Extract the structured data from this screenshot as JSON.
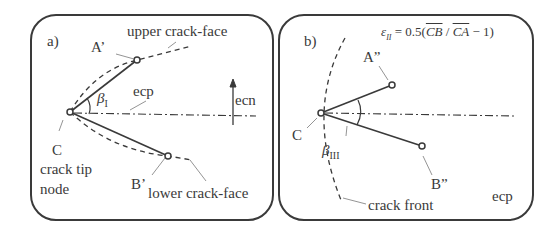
{
  "panel_a": {
    "tag": "a)",
    "point_A": "A’",
    "point_B": "B’",
    "point_C": "C",
    "upper_face": "upper crack-face",
    "lower_face": "lower crack-face",
    "tip_node_line1": "crack tip",
    "tip_node_line2": "node",
    "ecp": "ecp",
    "ecn": "ecn",
    "beta": "β",
    "beta_sub": "I"
  },
  "panel_b": {
    "tag": "b)",
    "formula": "ε",
    "formula_sub": "II",
    "formula_rest": " = 0.5(",
    "formula_cb": "CB",
    "formula_slash": " / ",
    "formula_ca": "CA",
    "formula_end": " − 1)",
    "point_A": "A”",
    "point_B": "B”",
    "point_C": "C",
    "beta": "β",
    "beta_sub": "III",
    "crack_front": "crack front",
    "ecp": "ecp"
  },
  "colors": {
    "line": "#3a3a3a",
    "leader": "#888888"
  }
}
